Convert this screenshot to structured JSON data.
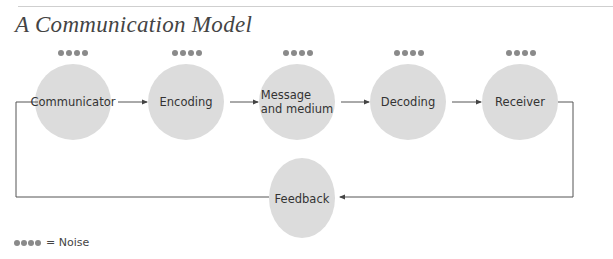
{
  "title": "A Communication Model",
  "nodes": [
    {
      "id": "communicator",
      "label": "Communicator",
      "cx": 73,
      "cy": 102
    },
    {
      "id": "encoding",
      "label": "Encoding",
      "cx": 186,
      "cy": 102
    },
    {
      "id": "message",
      "label": "Message\nand medium",
      "cx": 297,
      "cy": 102
    },
    {
      "id": "decoding",
      "label": "Decoding",
      "cx": 408,
      "cy": 102
    },
    {
      "id": "receiver",
      "label": "Receiver",
      "cx": 520,
      "cy": 102
    }
  ],
  "feedback": {
    "label": "Feedback",
    "cx": 302,
    "cy": 198
  },
  "legend": {
    "label": "= Noise"
  },
  "colors": {
    "circle": "#dcdcdc",
    "dot": "#8a8a8a",
    "line": "#555555"
  }
}
